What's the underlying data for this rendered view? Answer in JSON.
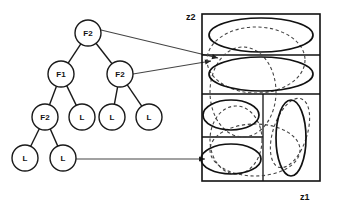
{
  "figure": {
    "axis_labels": {
      "vertical": "z2",
      "horizontal": "z1"
    }
  },
  "tree": {
    "nodes": [
      {
        "id": "n0",
        "label": "F2",
        "cx": 88,
        "cy": 33,
        "r": 13,
        "type": "internal",
        "level": 0
      },
      {
        "id": "n1",
        "label": "F1",
        "cx": 61,
        "cy": 74,
        "r": 13,
        "type": "internal",
        "level": 1
      },
      {
        "id": "n2",
        "label": "F2",
        "cx": 120,
        "cy": 74,
        "r": 13,
        "type": "internal",
        "level": 1
      },
      {
        "id": "n3",
        "label": "F2",
        "cx": 45,
        "cy": 117,
        "r": 13,
        "type": "internal",
        "level": 2
      },
      {
        "id": "n4",
        "label": "L",
        "cx": 82,
        "cy": 117,
        "r": 13,
        "type": "leaf",
        "level": 2
      },
      {
        "id": "n5",
        "label": "L",
        "cx": 112,
        "cy": 117,
        "r": 13,
        "type": "leaf",
        "level": 2
      },
      {
        "id": "n6",
        "label": "L",
        "cx": 149,
        "cy": 117,
        "r": 13,
        "type": "leaf",
        "level": 2
      },
      {
        "id": "n7",
        "label": "L",
        "cx": 25,
        "cy": 158,
        "r": 13,
        "type": "leaf",
        "level": 3
      },
      {
        "id": "n8",
        "label": "L",
        "cx": 63,
        "cy": 158,
        "r": 13,
        "type": "leaf",
        "level": 3
      }
    ],
    "edges": [
      {
        "from": "n0",
        "to": "n1"
      },
      {
        "from": "n0",
        "to": "n2"
      },
      {
        "from": "n1",
        "to": "n3"
      },
      {
        "from": "n1",
        "to": "n4"
      },
      {
        "from": "n2",
        "to": "n5"
      },
      {
        "from": "n2",
        "to": "n6"
      },
      {
        "from": "n3",
        "to": "n7"
      },
      {
        "from": "n3",
        "to": "n8"
      }
    ],
    "pointers": [
      {
        "name": "root-to-top-region",
        "from": "n0",
        "x1": 101,
        "y1": 30,
        "x2": 218,
        "y2": 58
      },
      {
        "name": "mid-to-second-region",
        "from": "n2",
        "x1": 133,
        "y1": 74,
        "x2": 211,
        "y2": 61
      },
      {
        "name": "leaf-to-lower-region",
        "from": "n8",
        "x1": 76,
        "y1": 159,
        "x2": 205,
        "y2": 159
      }
    ]
  },
  "panel": {
    "box": {
      "x": 202,
      "y": 14,
      "width": 118,
      "height": 167
    },
    "dividers": [
      {
        "name": "horizontal-divider-1",
        "orientation": "horizontal",
        "x1": 202,
        "y1": 55,
        "x2": 320,
        "y2": 55
      },
      {
        "name": "horizontal-divider-2",
        "orientation": "horizontal",
        "x1": 202,
        "y1": 94,
        "x2": 320,
        "y2": 94
      },
      {
        "name": "horizontal-divider-3",
        "orientation": "horizontal",
        "x1": 202,
        "y1": 137,
        "x2": 263,
        "y2": 137
      },
      {
        "name": "vertical-divider-1",
        "orientation": "vertical",
        "x1": 263,
        "y1": 94,
        "x2": 263,
        "y2": 181
      }
    ],
    "solid_ellipses": [
      {
        "name": "cluster-top",
        "cx": 261,
        "cy": 35,
        "rx": 52,
        "ry": 17,
        "rotate": 0
      },
      {
        "name": "cluster-second",
        "cx": 261,
        "cy": 74,
        "rx": 52,
        "ry": 17,
        "rotate": 0
      },
      {
        "name": "cluster-lower-left-1",
        "cx": 231,
        "cy": 115,
        "rx": 28,
        "ry": 15,
        "rotate": 0
      },
      {
        "name": "cluster-lower-left-2",
        "cx": 231,
        "cy": 159,
        "rx": 30,
        "ry": 15,
        "rotate": 0
      },
      {
        "name": "cluster-lower-right",
        "cx": 291,
        "cy": 138,
        "rx": 15,
        "ry": 38,
        "rotate": 0
      }
    ],
    "dashed_ellipses": [
      {
        "name": "overlay-top-large",
        "cx": 256,
        "cy": 60,
        "rx": 49,
        "ry": 33,
        "rotate": 0
      },
      {
        "name": "overlay-mid",
        "cx": 243,
        "cy": 92,
        "rx": 33,
        "ry": 45,
        "rotate": 0
      },
      {
        "name": "overlay-lower-left",
        "cx": 236,
        "cy": 140,
        "rx": 26,
        "ry": 34,
        "rotate": 0
      },
      {
        "name": "overlay-lower-wide",
        "cx": 255,
        "cy": 150,
        "rx": 45,
        "ry": 26,
        "rotate": 0
      },
      {
        "name": "overlay-lower-right",
        "cx": 290,
        "cy": 133,
        "rx": 17,
        "ry": 36,
        "rotate": 18
      }
    ]
  }
}
